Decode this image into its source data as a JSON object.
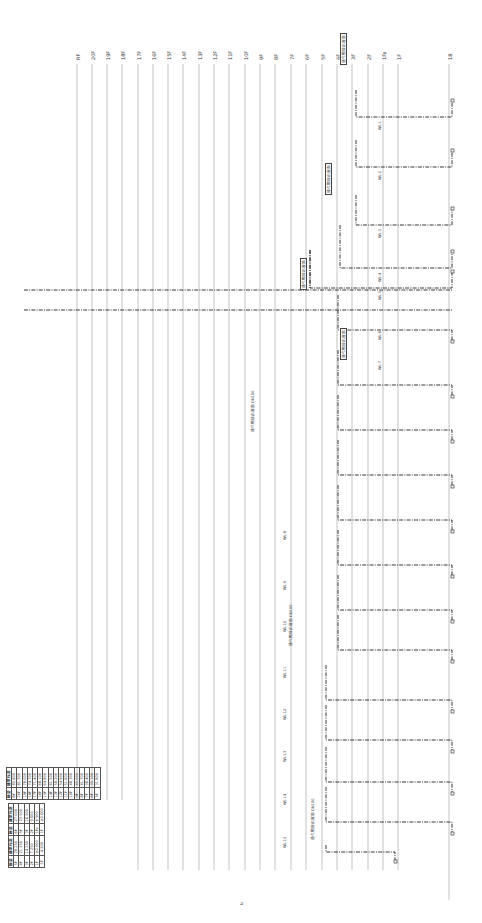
{
  "drawing": {
    "type": "drainage-riser-diagram",
    "orientation": "rotated-90-ccw",
    "floors": [
      {
        "label": "RF",
        "x": 77
      },
      {
        "label": "20F",
        "x": 92
      },
      {
        "label": "19F",
        "x": 107
      },
      {
        "label": "18F",
        "x": 122
      },
      {
        "label": "17F",
        "x": 138
      },
      {
        "label": "16F",
        "x": 153
      },
      {
        "label": "15F",
        "x": 168
      },
      {
        "label": "14F",
        "x": 183
      },
      {
        "label": "13F",
        "x": 199
      },
      {
        "label": "12F",
        "x": 214
      },
      {
        "label": "11F",
        "x": 229
      },
      {
        "label": "10F",
        "x": 245
      },
      {
        "label": "9F",
        "x": 260
      },
      {
        "label": "8F",
        "x": 275
      },
      {
        "label": "7F",
        "x": 291
      },
      {
        "label": "6F",
        "x": 306
      },
      {
        "label": "5F",
        "x": 322
      },
      {
        "label": "4F",
        "x": 337
      },
      {
        "label": "3F",
        "x": 352
      },
      {
        "label": "2F",
        "x": 368
      },
      {
        "label": "1Fa",
        "x": 383
      },
      {
        "label": "1F",
        "x": 398
      },
      {
        "label": "1B",
        "x": 449
      }
    ],
    "riser_tags": [
      {
        "text": "WL-1",
        "x": 378,
        "y": 130
      },
      {
        "text": "WL-2",
        "x": 378,
        "y": 180
      },
      {
        "text": "WL-3",
        "x": 378,
        "y": 238
      },
      {
        "text": "WL-4",
        "x": 378,
        "y": 282
      },
      {
        "text": "WL-5",
        "x": 378,
        "y": 300
      },
      {
        "text": "WL-6",
        "x": 378,
        "y": 340
      },
      {
        "text": "WL-7",
        "x": 378,
        "y": 370
      }
    ],
    "note_tags": [
      {
        "text": "通气帽接出屋面",
        "x": 340,
        "y": 65,
        "boxed": true
      },
      {
        "text": "通气帽接出屋面",
        "x": 325,
        "y": 195,
        "boxed": true
      },
      {
        "text": "通气帽接出屋面",
        "x": 300,
        "y": 290,
        "boxed": true
      },
      {
        "text": "通气帽接出屋面",
        "x": 340,
        "y": 360,
        "boxed": true
      },
      {
        "text": "通气帽接出屋面 DN100",
        "x": 250,
        "y": 432,
        "boxed": false
      },
      {
        "text": "通气帽接出屋面 DN100",
        "x": 288,
        "y": 646,
        "boxed": false
      },
      {
        "text": "通气帽接出屋面 DN100",
        "x": 310,
        "y": 840,
        "boxed": false
      }
    ],
    "pipe_tags": [
      {
        "text": "WL-8",
        "x": 283,
        "y": 540
      },
      {
        "text": "WL-9",
        "x": 283,
        "y": 590
      },
      {
        "text": "WL-10",
        "x": 283,
        "y": 632
      },
      {
        "text": "WL-11",
        "x": 283,
        "y": 678
      },
      {
        "text": "WL-12",
        "x": 283,
        "y": 720
      },
      {
        "text": "WL-13",
        "x": 283,
        "y": 762
      },
      {
        "text": "WL-14",
        "x": 283,
        "y": 805
      },
      {
        "text": "WL-15",
        "x": 283,
        "y": 848
      }
    ],
    "colors": {
      "floor_line": "#9a9a9a",
      "pipe": "#222222",
      "text": "#333333",
      "background": "#ffffff"
    }
  },
  "legend_main": {
    "headers": [
      "楼层",
      "建筑标高"
    ],
    "rows": [
      [
        "RF",
        "85.800"
      ],
      [
        "20F",
        "81.300"
      ],
      [
        "19F",
        "78.000"
      ],
      [
        "18F",
        "74.700"
      ],
      [
        "17F",
        "71.400"
      ],
      [
        "16F",
        "68.100"
      ],
      [
        "15F",
        "64.800"
      ],
      [
        "14F",
        "61.500"
      ],
      [
        "13F",
        "58.200"
      ],
      [
        "12F",
        "54.900"
      ],
      [
        "11F",
        "51.600"
      ],
      [
        "10F",
        "48.300"
      ],
      [
        "9F",
        "45.000"
      ],
      [
        "8F",
        "41.700"
      ],
      [
        "7F",
        "38.400"
      ],
      [
        "6F",
        "35.100"
      ],
      [
        "5F",
        "31.800"
      ]
    ]
  },
  "legend_lower": {
    "headers": [
      "楼层",
      "建筑标高",
      "楼层",
      "建筑标高"
    ],
    "rows": [
      [
        "5F",
        "28.250",
        "6F",
        "27.000"
      ],
      [
        "4F",
        "21.250",
        "5F",
        "23.500"
      ],
      [
        "3F",
        "14.250",
        "3F",
        "16.500"
      ],
      [
        "2F",
        "7.250",
        "2F",
        "9.000"
      ],
      [
        "1F",
        "±0.000",
        "1Fa",
        "4.500"
      ],
      [
        "-1F",
        "-4.500",
        "1F",
        "±0.000"
      ]
    ]
  },
  "north_mark": {
    "text": "N",
    "x": 240,
    "y": 905
  }
}
